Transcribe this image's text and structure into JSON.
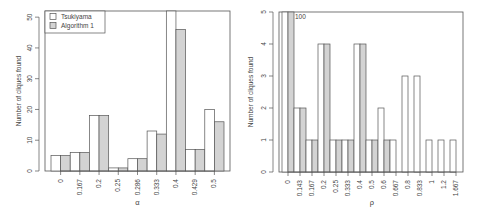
{
  "colors": {
    "tsukiyama": "#ffffff",
    "algorithm1": "#d3d3d3",
    "stroke": "#555555",
    "axis": "#555555"
  },
  "chart_data": [
    {
      "type": "bar",
      "title": "",
      "xlabel": "α",
      "ylabel": "Number of cliques found",
      "ylim": [
        0,
        52
      ],
      "yticks": [
        0,
        10,
        20,
        30,
        40,
        50
      ],
      "grid": false,
      "legend_position": "top-left",
      "categories": [
        "0",
        "0.167",
        "0.2",
        "0.25",
        "0.286",
        "0.333",
        "0.4",
        "0.429",
        "0.5"
      ],
      "series": [
        {
          "name": "Tsukiyama",
          "values": [
            5,
            6,
            18,
            1,
            4,
            13,
            60,
            7,
            20
          ]
        },
        {
          "name": "Algorithm 1",
          "values": [
            5,
            6,
            18,
            1,
            4,
            12,
            46,
            7,
            16
          ]
        }
      ],
      "annotations": []
    },
    {
      "type": "bar",
      "title": "",
      "xlabel": "ρ",
      "ylabel": "Number of cliques found",
      "ylim": [
        0,
        5
      ],
      "yticks": [
        0,
        1,
        2,
        3,
        4,
        5
      ],
      "grid": false,
      "categories": [
        "0",
        "0.143",
        "0.167",
        "0.2",
        "0.25",
        "0.333",
        "0.4",
        "0.5",
        "0.6",
        "0.667",
        "0.8",
        "0.833",
        "1",
        "1.2",
        "1.667"
      ],
      "series": [
        {
          "name": "Tsukiyama",
          "values": [
            100,
            2,
            1,
            4,
            1,
            1,
            4,
            1,
            2,
            1,
            3,
            3,
            1,
            1,
            1
          ]
        },
        {
          "name": "Algorithm 1",
          "values": [
            100,
            2,
            1,
            4,
            1,
            1,
            4,
            1,
            1,
            0,
            0,
            0,
            0,
            0,
            0
          ]
        }
      ],
      "annotations": [
        {
          "text": "100",
          "category": "0"
        }
      ]
    }
  ]
}
